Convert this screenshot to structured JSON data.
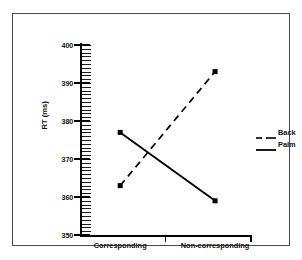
{
  "chart_data": {
    "type": "line",
    "title": "",
    "subtitle": "",
    "xlabel": "",
    "ylabel": "RT (ms)",
    "categories": [
      "Corresponding",
      "Non-corresponding"
    ],
    "series": [
      {
        "name": "Back",
        "values": [
          363,
          393
        ],
        "style": "dashed",
        "marker": "square",
        "color": "#000000"
      },
      {
        "name": "Palm",
        "values": [
          377,
          359
        ],
        "style": "solid",
        "marker": "square",
        "color": "#000000"
      }
    ],
    "ylim": [
      350,
      400
    ],
    "ytick_labels": [
      "400",
      "390",
      "380",
      "370",
      "360",
      "350"
    ],
    "ytick_values": [
      400,
      390,
      380,
      370,
      360,
      350
    ],
    "ytick_minor_step": 1,
    "grid": false,
    "legend_position": "right"
  },
  "axes": {
    "y_title": "RT (ms)",
    "y_labels": [
      "400",
      "390",
      "380",
      "370",
      "360",
      "350"
    ],
    "x_labels": [
      "Corresponding",
      "Non-corresponding"
    ]
  },
  "legend": {
    "entries": [
      {
        "label": "Back",
        "dash": "dashed"
      },
      {
        "label": "Palm",
        "dash": "solid"
      }
    ]
  },
  "colors": {
    "line": "#000000",
    "frame": "#4a4a4a",
    "text": "#111111",
    "background": "#ffffff"
  }
}
